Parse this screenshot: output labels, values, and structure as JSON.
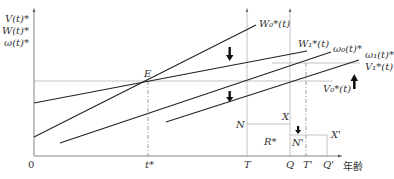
{
  "y_axis_labels": [
    "V(t)*",
    "W(t)*",
    "ω(t)*"
  ],
  "x_axis": {
    "origin": "0",
    "ticks": [
      "t*",
      "T",
      "Q",
      "T'",
      "Q'"
    ],
    "title": "年齢"
  },
  "curves": {
    "W0": "W₀*(t)",
    "W1": "W₁*(t)",
    "omega0": "ω₀(t)*",
    "omega1": "ω₁(t)*",
    "V1": "V₁*(t)",
    "V0": "V₀*(t)"
  },
  "points": {
    "E": "E",
    "N": "N",
    "X": "X",
    "R": "R*",
    "N_prime": "N'",
    "X_prime": "X'"
  },
  "arrows": [
    {
      "name": "W-shift-down",
      "direction": "down"
    },
    {
      "name": "omega-shift-down",
      "direction": "down"
    },
    {
      "name": "V-shift-up",
      "direction": "up"
    },
    {
      "name": "N-shift-down",
      "direction": "down"
    }
  ]
}
